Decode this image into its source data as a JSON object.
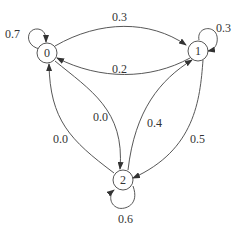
{
  "diagram": {
    "type": "markov-chain",
    "nodes": [
      {
        "id": "0",
        "label": "0"
      },
      {
        "id": "1",
        "label": "1"
      },
      {
        "id": "2",
        "label": "2"
      }
    ],
    "edges": [
      {
        "from": "0",
        "to": "0",
        "label": "0.7"
      },
      {
        "from": "0",
        "to": "1",
        "label": "0.3"
      },
      {
        "from": "1",
        "to": "1",
        "label": "0.3"
      },
      {
        "from": "1",
        "to": "0",
        "label": "0.2"
      },
      {
        "from": "0",
        "to": "2",
        "label": "0.0"
      },
      {
        "from": "2",
        "to": "0",
        "label": "0.0"
      },
      {
        "from": "2",
        "to": "1",
        "label": "0.4"
      },
      {
        "from": "1",
        "to": "2",
        "label": "0.5"
      },
      {
        "from": "2",
        "to": "2",
        "label": "0.6"
      }
    ]
  }
}
